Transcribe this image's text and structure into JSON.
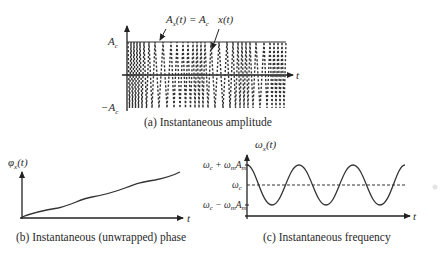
{
  "panels": {
    "a": {
      "caption": "(a) Instantaneous amplitude",
      "envelope_label_main": "A",
      "envelope_label_sub": "x",
      "envelope_label_rest": "(t) = A",
      "envelope_label_sub2": "c",
      "signal_label": "x(t)",
      "y_top_label": "A",
      "y_top_sub": "c",
      "y_bottom_label": "−A",
      "y_bottom_sub": "c",
      "x_label": "t"
    },
    "b": {
      "caption": "(b) Instantaneous (unwrapped) phase",
      "y_label_main": "φ",
      "y_label_sub": "x",
      "y_label_rest": "(t)",
      "x_label": "t"
    },
    "c": {
      "caption": "(c) Instantaneous frequency",
      "y_label_main": "ω",
      "y_label_sub": "x",
      "y_label_rest": "(t)",
      "tick_top": "ω",
      "tick_top_sub": "c",
      "tick_top_rest": " + ω",
      "tick_top_sub2": "m",
      "tick_top_rest2": "A",
      "tick_top_sub3": "m",
      "tick_mid": "ω",
      "tick_mid_sub": "c",
      "tick_bottom": "ω",
      "tick_bottom_sub": "c",
      "tick_bottom_rest": " − ω",
      "tick_bottom_sub2": "m",
      "tick_bottom_rest2": "A",
      "tick_bottom_sub3": "m",
      "x_label": "t"
    }
  }
}
